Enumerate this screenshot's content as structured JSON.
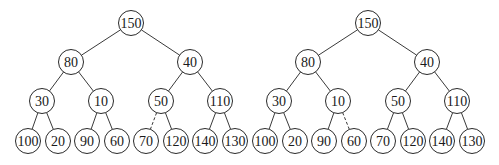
{
  "figure": {
    "node_radius": 12.5,
    "colors": {
      "stroke": "#2a2a2a",
      "fill": "#ffffff",
      "text": "#1a1a1a"
    },
    "trees": [
      {
        "id": "left",
        "nodes": [
          {
            "id": "n150",
            "label": "150",
            "x": 131,
            "y": 23
          },
          {
            "id": "n80",
            "label": "80",
            "x": 71,
            "y": 62
          },
          {
            "id": "n40",
            "label": "40",
            "x": 190,
            "y": 62
          },
          {
            "id": "n30",
            "label": "30",
            "x": 42,
            "y": 101
          },
          {
            "id": "n10",
            "label": "10",
            "x": 101,
            "y": 101
          },
          {
            "id": "n50",
            "label": "50",
            "x": 161,
            "y": 101
          },
          {
            "id": "n110",
            "label": "110",
            "x": 220,
            "y": 101
          },
          {
            "id": "n100",
            "label": "100",
            "x": 28,
            "y": 141
          },
          {
            "id": "n20",
            "label": "20",
            "x": 58,
            "y": 141
          },
          {
            "id": "n90",
            "label": "90",
            "x": 87,
            "y": 141
          },
          {
            "id": "n60",
            "label": "60",
            "x": 117,
            "y": 141
          },
          {
            "id": "n70",
            "label": "70",
            "x": 146,
            "y": 141
          },
          {
            "id": "n120",
            "label": "120",
            "x": 176,
            "y": 141
          },
          {
            "id": "n140",
            "label": "140",
            "x": 205,
            "y": 141
          },
          {
            "id": "n130",
            "label": "130",
            "x": 235,
            "y": 141
          }
        ],
        "edges": [
          {
            "from": "n150",
            "to": "n80",
            "style": "solid"
          },
          {
            "from": "n150",
            "to": "n40",
            "style": "solid"
          },
          {
            "from": "n80",
            "to": "n30",
            "style": "solid"
          },
          {
            "from": "n80",
            "to": "n10",
            "style": "solid"
          },
          {
            "from": "n40",
            "to": "n50",
            "style": "solid"
          },
          {
            "from": "n40",
            "to": "n110",
            "style": "solid"
          },
          {
            "from": "n30",
            "to": "n100",
            "style": "solid"
          },
          {
            "from": "n30",
            "to": "n20",
            "style": "solid"
          },
          {
            "from": "n10",
            "to": "n90",
            "style": "solid"
          },
          {
            "from": "n10",
            "to": "n60",
            "style": "solid"
          },
          {
            "from": "n50",
            "to": "n70",
            "style": "dashed"
          },
          {
            "from": "n50",
            "to": "n120",
            "style": "solid"
          },
          {
            "from": "n110",
            "to": "n140",
            "style": "solid"
          },
          {
            "from": "n110",
            "to": "n130",
            "style": "solid"
          }
        ]
      },
      {
        "id": "right",
        "nodes": [
          {
            "id": "n150",
            "label": "150",
            "x": 368,
            "y": 23
          },
          {
            "id": "n80",
            "label": "80",
            "x": 308,
            "y": 62
          },
          {
            "id": "n40",
            "label": "40",
            "x": 427,
            "y": 62
          },
          {
            "id": "n30",
            "label": "30",
            "x": 279,
            "y": 101
          },
          {
            "id": "n10",
            "label": "10",
            "x": 338,
            "y": 101
          },
          {
            "id": "n50",
            "label": "50",
            "x": 398,
            "y": 101
          },
          {
            "id": "n110",
            "label": "110",
            "x": 457,
            "y": 101
          },
          {
            "id": "n100",
            "label": "100",
            "x": 265,
            "y": 141
          },
          {
            "id": "n20",
            "label": "20",
            "x": 295,
            "y": 141
          },
          {
            "id": "n90",
            "label": "90",
            "x": 324,
            "y": 141
          },
          {
            "id": "n60",
            "label": "60",
            "x": 354,
            "y": 141
          },
          {
            "id": "n70",
            "label": "70",
            "x": 383,
            "y": 141
          },
          {
            "id": "n120",
            "label": "120",
            "x": 413,
            "y": 141
          },
          {
            "id": "n140",
            "label": "140",
            "x": 442,
            "y": 141
          },
          {
            "id": "n130",
            "label": "130",
            "x": 472,
            "y": 141
          }
        ],
        "edges": [
          {
            "from": "n150",
            "to": "n80",
            "style": "solid"
          },
          {
            "from": "n150",
            "to": "n40",
            "style": "solid"
          },
          {
            "from": "n80",
            "to": "n30",
            "style": "solid"
          },
          {
            "from": "n80",
            "to": "n10",
            "style": "solid"
          },
          {
            "from": "n40",
            "to": "n50",
            "style": "solid"
          },
          {
            "from": "n40",
            "to": "n110",
            "style": "solid"
          },
          {
            "from": "n30",
            "to": "n100",
            "style": "solid"
          },
          {
            "from": "n30",
            "to": "n20",
            "style": "solid"
          },
          {
            "from": "n10",
            "to": "n90",
            "style": "solid"
          },
          {
            "from": "n10",
            "to": "n60",
            "style": "dashed"
          },
          {
            "from": "n50",
            "to": "n70",
            "style": "solid"
          },
          {
            "from": "n50",
            "to": "n120",
            "style": "solid"
          },
          {
            "from": "n110",
            "to": "n140",
            "style": "solid"
          },
          {
            "from": "n110",
            "to": "n130",
            "style": "solid"
          }
        ]
      }
    ]
  }
}
